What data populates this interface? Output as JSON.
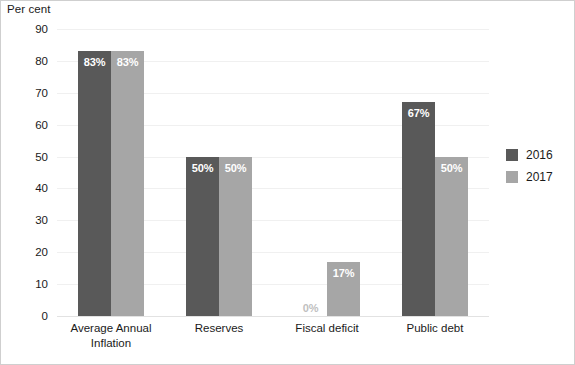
{
  "chart_data": {
    "type": "bar",
    "title": "",
    "subtitle": "",
    "xlabel": "",
    "ylabel": "Per cent",
    "ylim": [
      0,
      90
    ],
    "ytick_step": 10,
    "yticks": [
      "90",
      "80",
      "70",
      "60",
      "50",
      "40",
      "30",
      "20",
      "10",
      "0"
    ],
    "grid": true,
    "legend_position": "right",
    "categories": [
      "Average Annual Inflation",
      "Reserves",
      "Fiscal deficit",
      "Public debt"
    ],
    "category_lines": [
      [
        "Average Annual",
        "Inflation"
      ],
      [
        "Reserves"
      ],
      [
        "Fiscal deficit"
      ],
      [
        "Public debt"
      ]
    ],
    "series": [
      {
        "name": "2016",
        "color": "#595959",
        "values": [
          83,
          50,
          0,
          67
        ],
        "labels": [
          "83%",
          "50%",
          "0%",
          "67%"
        ]
      },
      {
        "name": "2017",
        "color": "#a6a6a6",
        "values": [
          83,
          50,
          17,
          50
        ],
        "labels": [
          "83%",
          "50%",
          "17%",
          "50%"
        ]
      }
    ]
  },
  "legend": {
    "items": [
      {
        "label": "2016",
        "color": "#595959"
      },
      {
        "label": "2017",
        "color": "#a6a6a6"
      }
    ]
  },
  "axis": {
    "y_title": "Per cent"
  }
}
